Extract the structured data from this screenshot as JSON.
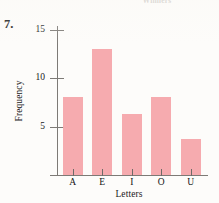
{
  "page": {
    "running_head": "Winners",
    "item_number": "7."
  },
  "chart_data": {
    "type": "bar",
    "title": "",
    "categories": [
      "A",
      "E",
      "I",
      "O",
      "U"
    ],
    "values": [
      8,
      13,
      6.3,
      8,
      3.7
    ],
    "xlabel": "Letters",
    "ylabel": "Frequency",
    "ylim": [
      0,
      16
    ],
    "yticks": [
      5,
      10,
      15
    ],
    "ytick_labels": [
      "5",
      "10",
      "15"
    ],
    "grid": false,
    "legend": null,
    "bar_color": "#f6a6ab",
    "axis_color": "#7d7a76"
  }
}
